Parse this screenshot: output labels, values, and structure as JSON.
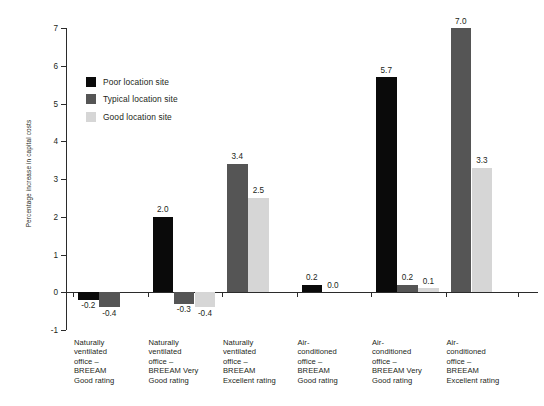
{
  "chart_data": {
    "type": "bar",
    "title": "",
    "xlabel": "",
    "ylabel": "Percentage increase in capital costs",
    "ylim": [
      -1,
      7
    ],
    "yticks": [
      -1,
      0,
      1,
      2,
      3,
      4,
      5,
      6,
      7
    ],
    "ytick_labels": [
      "-1",
      "0",
      "1",
      "2",
      "3",
      "4",
      "5",
      "6",
      "7"
    ],
    "grid": false,
    "legend_position": "upper-left-inside",
    "categories": [
      "Naturally ventilated office – BREEAM Good rating",
      "Naturally ventilated office – BREEAM Very Good rating",
      "Naturally ventilated office – BREEAM Excellent rating",
      "Air-conditioned office – BREEAM Good rating",
      "Air-conditioned office – BREEAM Very Good rating",
      "Air-conditioned office – BREEAM Excellent rating"
    ],
    "category_lines": [
      [
        "Naturally",
        "ventilated",
        "office –",
        "BREEAM",
        "Good rating"
      ],
      [
        "Naturally",
        "ventilated",
        "office –",
        "BREEAM Very",
        "Good rating"
      ],
      [
        "Naturally",
        "ventilated",
        "office –",
        "BREEAM",
        "Excellent rating"
      ],
      [
        "Air-",
        "conditioned",
        "office –",
        "BREEAM",
        "Good rating"
      ],
      [
        "Air-",
        "conditioned",
        "office –",
        "BREEAM Very",
        "Good rating"
      ],
      [
        "Air-",
        "conditioned",
        "office –",
        "BREEAM",
        "Excellent rating"
      ]
    ],
    "series": [
      {
        "name": "Poor location site",
        "color": "#0a0a0a",
        "values": [
          -0.2,
          2.0,
          null,
          0.2,
          5.7,
          null
        ],
        "labels": [
          "-0.2",
          "2.0",
          "",
          "0.2",
          "5.7",
          ""
        ]
      },
      {
        "name": "Typical location site",
        "color": "#555555",
        "values": [
          -0.4,
          -0.3,
          3.4,
          0.0,
          0.2,
          7.0
        ],
        "labels": [
          "-0.4",
          "-0.3",
          "3.4",
          "0.0",
          "0.2",
          "7.0"
        ]
      },
      {
        "name": "Good location site",
        "color": "#d6d6d6",
        "values": [
          null,
          -0.4,
          2.5,
          null,
          0.1,
          3.3
        ],
        "labels": [
          "",
          "-0.4",
          "2.5",
          "",
          "0.1",
          "3.3"
        ]
      }
    ]
  },
  "legend": {
    "items": [
      {
        "label": "Poor location site",
        "key": "poor"
      },
      {
        "label": "Typical location site",
        "key": "typical"
      },
      {
        "label": "Good location site",
        "key": "good"
      }
    ]
  },
  "axis": {
    "y_title": "Percentage increase in capital costs"
  }
}
